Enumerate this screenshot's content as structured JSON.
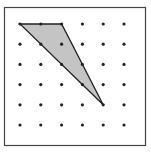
{
  "diagram": {
    "type": "dot-grid-geoboard",
    "frame": {
      "x": 4.5,
      "y": 7.5,
      "width": 141,
      "height": 138,
      "stroke": "#444444"
    },
    "grid": {
      "cols": 6,
      "rows": 6,
      "origin_x": 20,
      "origin_y": 24,
      "spacing_x": 20.8,
      "spacing_y": 20.2,
      "dot_radius": 1.6,
      "dot_color": "#222222"
    },
    "shape": {
      "kind": "triangle",
      "vertices_grid": [
        [
          0,
          0
        ],
        [
          2,
          0
        ],
        [
          4,
          4
        ]
      ],
      "fill": "#c4c4c4",
      "stroke": "#222222"
    }
  }
}
